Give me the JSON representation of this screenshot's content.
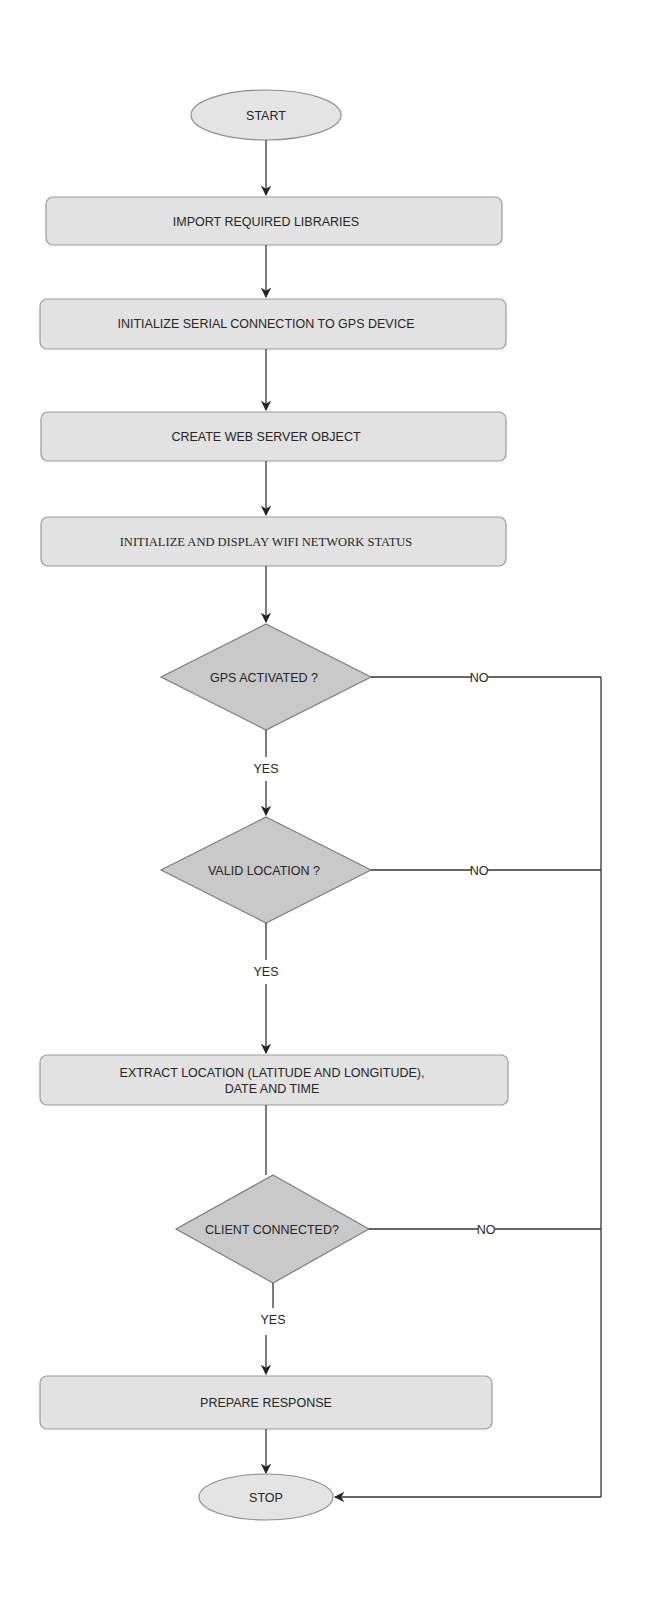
{
  "diagram": {
    "nodes": {
      "start": {
        "label": "START",
        "type": "terminal"
      },
      "import": {
        "label": "IMPORT REQUIRED LIBRARIES",
        "type": "process"
      },
      "serial": {
        "label": "INITIALIZE SERIAL CONNECTION TO GPS DEVICE",
        "type": "process"
      },
      "webserver": {
        "label": "CREATE WEB SERVER OBJECT",
        "type": "process"
      },
      "wifi": {
        "label": "INITIALIZE AND DISPLAY WIFI NETWORK STATUS",
        "type": "process"
      },
      "gps_activated": {
        "label": "GPS ACTIVATED ?",
        "type": "decision"
      },
      "valid_location": {
        "label": "VALID LOCATION ?",
        "type": "decision"
      },
      "extract": {
        "label_line1": "EXTRACT LOCATION (LATITUDE AND LONGITUDE),",
        "label_line2": "DATE AND TIME",
        "type": "process"
      },
      "client_connected": {
        "label": "CLIENT CONNECTED?",
        "type": "decision"
      },
      "prepare": {
        "label": "PREPARE RESPONSE",
        "type": "process"
      },
      "stop": {
        "label": "STOP",
        "type": "terminal"
      }
    },
    "edges": {
      "gps_yes": "YES",
      "gps_no": "NO",
      "valid_yes": "YES",
      "valid_no": "NO",
      "client_yes": "YES",
      "client_no": "NO"
    },
    "colors": {
      "process_fill": "#e2e2e2",
      "decision_fill": "#c9c9c9",
      "terminal_fill": "#e4e4e4",
      "line": "#333333"
    }
  }
}
